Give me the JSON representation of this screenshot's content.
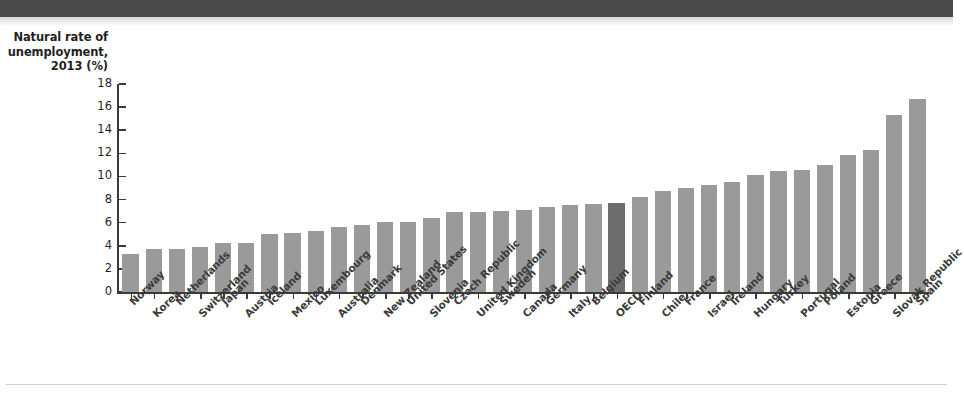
{
  "figure": {
    "axis_caption_lines": [
      "Natural rate of",
      "unemployment,",
      "2013 (%)"
    ],
    "axis_caption": "Natural rate of unemployment, 2013 (%)",
    "bar_color": "#9a9a9a",
    "highlight_color": "#6d6d6d",
    "highlight_category": "OECD"
  },
  "chart_data": {
    "type": "bar",
    "title": "",
    "xlabel": "",
    "ylabel": "Natural rate of unemployment, 2013 (%)",
    "ylim": [
      0,
      18
    ],
    "ytick_values": [
      0,
      2,
      4,
      6,
      8,
      10,
      12,
      14,
      16,
      18
    ],
    "ytick_labels": [
      "0",
      "2",
      "4",
      "6",
      "8",
      "10",
      "12",
      "14",
      "16",
      "18"
    ],
    "grid": false,
    "legend": null,
    "categories": [
      "Norway",
      "Korea",
      "Netherlands",
      "Switzerland",
      "Japan",
      "Austria",
      "Iceland",
      "Mexico",
      "Luxembourg",
      "Australia",
      "Denmark",
      "New Zealand",
      "United States",
      "Slovenia",
      "Czech Republic",
      "United Kingdom",
      "Sweden",
      "Canada",
      "Germany",
      "Italy",
      "Belgium",
      "OECD",
      "Finland",
      "Chile",
      "France",
      "Israel",
      "Ireland",
      "Hungary",
      "Turkey",
      "Portugal",
      "Poland",
      "Estonia",
      "Greece",
      "Slovak Republic",
      "Spain"
    ],
    "values": [
      3.3,
      3.7,
      3.7,
      3.9,
      4.2,
      4.2,
      5.0,
      5.1,
      5.3,
      5.6,
      5.8,
      6.1,
      6.1,
      6.4,
      6.9,
      6.9,
      7.0,
      7.1,
      7.4,
      7.5,
      7.6,
      7.7,
      8.2,
      8.7,
      9.0,
      9.3,
      9.5,
      10.1,
      10.5,
      10.6,
      11.0,
      11.9,
      12.3,
      15.3,
      16.7
    ],
    "highlight_index": 21
  }
}
